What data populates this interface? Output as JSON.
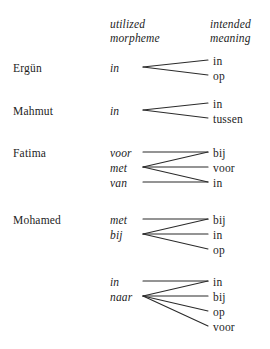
{
  "figure": {
    "type": "diagram",
    "subtype": "bipartite-mapping",
    "background_color": "#ffffff",
    "line_color": "#2b2b2b",
    "text_color": "#1d1d1d"
  },
  "headers": {
    "left_column": "utilized\nmorpheme",
    "left_column_line1": "utilized",
    "left_column_line2": "morpheme",
    "right_column": "intended\nmeaning",
    "right_column_line1": "intended",
    "right_column_line2": "meaning"
  },
  "groups": [
    {
      "id": "ergun",
      "name": "Ergün",
      "name_y": 67,
      "morphemes": [
        {
          "id": "erg-m0",
          "text": "in",
          "y": 67
        }
      ],
      "meanings": [
        {
          "id": "erg-t0",
          "text": "in",
          "y": 60
        },
        {
          "id": "erg-t1",
          "text": "op",
          "y": 75
        }
      ],
      "links": [
        {
          "from": "erg-m0",
          "to": "erg-t0"
        },
        {
          "from": "erg-m0",
          "to": "erg-t1"
        }
      ]
    },
    {
      "id": "mahmut",
      "name": "Mahmut",
      "name_y": 110,
      "morphemes": [
        {
          "id": "mah-m0",
          "text": "in",
          "y": 110
        }
      ],
      "meanings": [
        {
          "id": "mah-t0",
          "text": "in",
          "y": 103
        },
        {
          "id": "mah-t1",
          "text": "tussen",
          "y": 118
        }
      ],
      "links": [
        {
          "from": "mah-m0",
          "to": "mah-t0"
        },
        {
          "from": "mah-m0",
          "to": "mah-t1"
        }
      ]
    },
    {
      "id": "fatima",
      "name": "Fatima",
      "name_y": 152,
      "morphemes": [
        {
          "id": "fat-m0",
          "text": "voor",
          "y": 152
        },
        {
          "id": "fat-m1",
          "text": "met",
          "y": 167
        },
        {
          "id": "fat-m2",
          "text": "van",
          "y": 182
        }
      ],
      "meanings": [
        {
          "id": "fat-t0",
          "text": "bij",
          "y": 152
        },
        {
          "id": "fat-t1",
          "text": "voor",
          "y": 167
        },
        {
          "id": "fat-t2",
          "text": "in",
          "y": 182
        }
      ],
      "links": [
        {
          "from": "fat-m0",
          "to": "fat-t0"
        },
        {
          "from": "fat-m1",
          "to": "fat-t0"
        },
        {
          "from": "fat-m1",
          "to": "fat-t1"
        },
        {
          "from": "fat-m1",
          "to": "fat-t2"
        },
        {
          "from": "fat-m2",
          "to": "fat-t2"
        }
      ]
    },
    {
      "id": "mohamed",
      "name": "Mohamed",
      "name_y": 219,
      "morphemes": [
        {
          "id": "moh-m0",
          "text": "met",
          "y": 219
        },
        {
          "id": "moh-m1",
          "text": "bij",
          "y": 234
        }
      ],
      "meanings": [
        {
          "id": "moh-t0",
          "text": "bij",
          "y": 219
        },
        {
          "id": "moh-t1",
          "text": "in",
          "y": 234
        },
        {
          "id": "moh-t2",
          "text": "op",
          "y": 249
        }
      ],
      "links": [
        {
          "from": "moh-m0",
          "to": "moh-t0"
        },
        {
          "from": "moh-m1",
          "to": "moh-t0"
        },
        {
          "from": "moh-m1",
          "to": "moh-t1"
        },
        {
          "from": "moh-m1",
          "to": "moh-t2"
        }
      ]
    },
    {
      "id": "unnamed",
      "name": "",
      "name_y": 281,
      "morphemes": [
        {
          "id": "unn-m0",
          "text": "in",
          "y": 281
        },
        {
          "id": "unn-m1",
          "text": "naar",
          "y": 296
        }
      ],
      "meanings": [
        {
          "id": "unn-t0",
          "text": "in",
          "y": 281
        },
        {
          "id": "unn-t1",
          "text": "bij",
          "y": 296
        },
        {
          "id": "unn-t2",
          "text": "op",
          "y": 311
        },
        {
          "id": "unn-t3",
          "text": "voor",
          "y": 326
        }
      ],
      "links": [
        {
          "from": "unn-m0",
          "to": "unn-t0"
        },
        {
          "from": "unn-m1",
          "to": "unn-t0"
        },
        {
          "from": "unn-m1",
          "to": "unn-t1"
        },
        {
          "from": "unn-m1",
          "to": "unn-t2"
        },
        {
          "from": "unn-m1",
          "to": "unn-t3"
        }
      ]
    }
  ],
  "layout": {
    "name_x": 13,
    "morpheme_x": 110,
    "meaning_x": 213,
    "link_start_x": 143,
    "link_end_x": 208
  }
}
